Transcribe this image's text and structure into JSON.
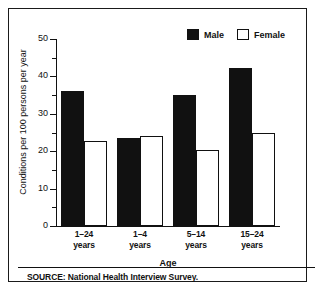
{
  "chart_data": {
    "type": "bar",
    "title": "",
    "xlabel": "Age",
    "ylabel": "Conditions per 100 persons per year",
    "ylim": [
      0,
      50
    ],
    "ytick_labels": [
      "0",
      "10",
      "20",
      "30",
      "40",
      "50"
    ],
    "ytick_values": [
      0,
      10,
      20,
      30,
      40,
      50
    ],
    "yminor_values": [
      5,
      15,
      25,
      35,
      45
    ],
    "grid": false,
    "legend_position": "top-right",
    "categories": [
      "1–24\nyears",
      "1–4\nyears",
      "5–14\nyears",
      "15–24\nyears"
    ],
    "category_lines": [
      {
        "line1": "1–24",
        "line2": "years"
      },
      {
        "line1": "1–4",
        "line2": "years"
      },
      {
        "line1": "5–14",
        "line2": "years"
      },
      {
        "line1": "15–24",
        "line2": "years"
      }
    ],
    "series": [
      {
        "name": "Male",
        "fill": "solid-black",
        "color": "#111111",
        "values": [
          36,
          23.5,
          35,
          42.3
        ]
      },
      {
        "name": "Female",
        "fill": "checkered",
        "color": "#111111",
        "values": [
          22.7,
          24,
          20.2,
          25
        ]
      }
    ],
    "source": "SOURCE: National Health Interview Survey."
  },
  "legend": {
    "items": [
      {
        "label": "Male",
        "swatch": "solid-black-swatch"
      },
      {
        "label": "Female",
        "swatch": "checkered-swatch"
      }
    ]
  },
  "axes": {
    "y_label": "Conditions per 100 persons per year",
    "x_label": "Age",
    "y_ticks": [
      "50",
      "40",
      "30",
      "20",
      "10",
      "0"
    ]
  },
  "footer": {
    "source": "SOURCE: National Health Interview Survey."
  }
}
